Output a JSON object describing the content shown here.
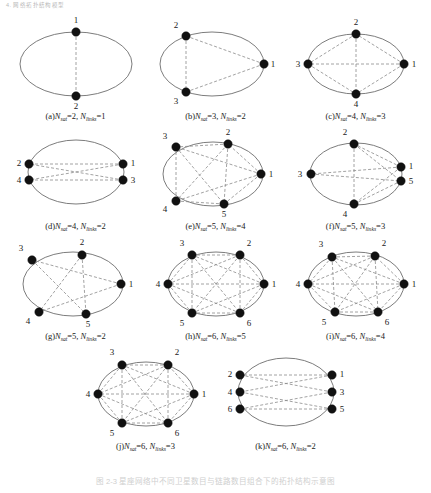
{
  "header": {
    "running_head": "4. 网络拓扑结构模型"
  },
  "figure": {
    "caption": "图 2-3   星座网络中不同卫星数目与链路数目组合下的拓扑结构示意图",
    "link_style": "dashed",
    "ellipse_style": "solid",
    "colors": {
      "node": "#111111",
      "ellipse": "#6d6d6d",
      "link": "#8a8a8a",
      "label": "#1a1a1a"
    },
    "symbols": {
      "n_sat": "N",
      "n_sat_sub": "sat",
      "n_links": "N",
      "n_links_sub": "links"
    },
    "panels": [
      {
        "id": "a",
        "tag": "(a)",
        "n_sat": 2,
        "n_links": 1,
        "caption_prefix": "(a)",
        "caption_text": "(a)Nsat=2, Nlinks=1",
        "width": 140,
        "height": 100,
        "ellipse": {
          "cx": 70,
          "cy": 52,
          "rx": 56,
          "ry": 32
        },
        "nodes": [
          {
            "label": "1",
            "x": 70,
            "y": 20,
            "lx": 70,
            "ly": 11,
            "anchor": "middle"
          },
          {
            "label": "2",
            "x": 70,
            "y": 84,
            "lx": 70,
            "ly": 97,
            "anchor": "middle"
          }
        ],
        "links": [
          [
            0,
            1
          ]
        ]
      },
      {
        "id": "b",
        "tag": "(b)",
        "n_sat": 3,
        "n_links": 2,
        "caption_prefix": "(b)",
        "caption_text": "(b)Nsat=3, Nlinks=2",
        "width": 140,
        "height": 100,
        "ellipse": {
          "cx": 66,
          "cy": 52,
          "rx": 52,
          "ry": 32
        },
        "nodes": [
          {
            "label": "1",
            "x": 118,
            "y": 52,
            "lx": 127,
            "ly": 55,
            "anchor": "middle"
          },
          {
            "label": "2",
            "x": 40,
            "y": 24,
            "lx": 30,
            "ly": 16,
            "anchor": "middle"
          },
          {
            "label": "3",
            "x": 40,
            "y": 80,
            "lx": 30,
            "ly": 92,
            "anchor": "middle"
          }
        ],
        "links": [
          [
            0,
            1
          ],
          [
            0,
            2
          ],
          [
            1,
            2
          ]
        ]
      },
      {
        "id": "c",
        "tag": "(c)",
        "n_sat": 4,
        "n_links": 3,
        "caption_prefix": "(c)",
        "caption_text": "(c)Nsat=4, Nlinks=3",
        "width": 140,
        "height": 100,
        "ellipse": {
          "cx": 70,
          "cy": 52,
          "rx": 48,
          "ry": 30
        },
        "nodes": [
          {
            "label": "1",
            "x": 118,
            "y": 52,
            "lx": 128,
            "ly": 55,
            "anchor": "middle"
          },
          {
            "label": "2",
            "x": 70,
            "y": 22,
            "lx": 70,
            "ly": 13,
            "anchor": "middle"
          },
          {
            "label": "3",
            "x": 22,
            "y": 52,
            "lx": 12,
            "ly": 55,
            "anchor": "middle"
          },
          {
            "label": "4",
            "x": 70,
            "y": 82,
            "lx": 70,
            "ly": 95,
            "anchor": "middle"
          }
        ],
        "links": [
          [
            0,
            1
          ],
          [
            0,
            2
          ],
          [
            0,
            3
          ],
          [
            1,
            2
          ],
          [
            1,
            3
          ],
          [
            2,
            3
          ]
        ]
      },
      {
        "id": "d",
        "tag": "(d)",
        "n_sat": 4,
        "n_links": 2,
        "caption_prefix": "(d)",
        "caption_text": "(d)Nsat=4, Nlinks=2",
        "width": 140,
        "height": 100,
        "ellipse": {
          "cx": 70,
          "cy": 50,
          "rx": 48,
          "ry": 32
        },
        "nodes": [
          {
            "label": "1",
            "x": 117,
            "y": 42,
            "lx": 127,
            "ly": 44,
            "anchor": "middle"
          },
          {
            "label": "2",
            "x": 23,
            "y": 42,
            "lx": 13,
            "ly": 44,
            "anchor": "middle"
          },
          {
            "label": "3",
            "x": 117,
            "y": 58,
            "lx": 127,
            "ly": 61,
            "anchor": "middle"
          },
          {
            "label": "4",
            "x": 23,
            "y": 58,
            "lx": 13,
            "ly": 61,
            "anchor": "middle"
          }
        ],
        "links": [
          [
            0,
            1
          ],
          [
            0,
            3
          ],
          [
            2,
            1
          ],
          [
            2,
            3
          ]
        ]
      },
      {
        "id": "e",
        "tag": "(e)",
        "n_sat": 5,
        "n_links": 4,
        "caption_prefix": "(e)",
        "caption_text": "(e)Nsat=5, Nlinks=4",
        "width": 140,
        "height": 100,
        "ellipse": {
          "cx": 67,
          "cy": 52,
          "rx": 50,
          "ry": 32
        },
        "nodes": [
          {
            "label": "1",
            "x": 115,
            "y": 52,
            "lx": 125,
            "ly": 55,
            "anchor": "middle"
          },
          {
            "label": "2",
            "x": 82,
            "y": 22,
            "lx": 82,
            "ly": 13,
            "anchor": "middle"
          },
          {
            "label": "3",
            "x": 30,
            "y": 25,
            "lx": 19,
            "ly": 17,
            "anchor": "middle"
          },
          {
            "label": "4",
            "x": 30,
            "y": 79,
            "lx": 19,
            "ly": 90,
            "anchor": "middle"
          },
          {
            "label": "5",
            "x": 78,
            "y": 82,
            "lx": 78,
            "ly": 95,
            "anchor": "middle"
          }
        ],
        "links": [
          [
            0,
            1
          ],
          [
            0,
            2
          ],
          [
            0,
            3
          ],
          [
            0,
            4
          ],
          [
            1,
            2
          ],
          [
            1,
            3
          ],
          [
            1,
            4
          ],
          [
            2,
            3
          ],
          [
            2,
            4
          ],
          [
            3,
            4
          ]
        ]
      },
      {
        "id": "f",
        "tag": "(f)",
        "n_sat": 5,
        "n_links": 3,
        "caption_prefix": "(f)",
        "caption_text": "(f)Nsat=5, Nlinks=3",
        "width": 140,
        "height": 100,
        "ellipse": {
          "cx": 70,
          "cy": 52,
          "rx": 46,
          "ry": 31
        },
        "nodes": [
          {
            "label": "1",
            "x": 115,
            "y": 45,
            "lx": 125,
            "ly": 47,
            "anchor": "middle"
          },
          {
            "label": "2",
            "x": 68,
            "y": 22,
            "lx": 59,
            "ly": 13,
            "anchor": "middle"
          },
          {
            "label": "3",
            "x": 25,
            "y": 52,
            "lx": 14,
            "ly": 55,
            "anchor": "middle"
          },
          {
            "label": "4",
            "x": 68,
            "y": 82,
            "lx": 59,
            "ly": 95,
            "anchor": "middle"
          },
          {
            "label": "5",
            "x": 115,
            "y": 59,
            "lx": 125,
            "ly": 62,
            "anchor": "middle"
          }
        ],
        "links": [
          [
            0,
            1
          ],
          [
            0,
            2
          ],
          [
            0,
            3
          ],
          [
            1,
            4
          ],
          [
            2,
            4
          ],
          [
            3,
            4
          ],
          [
            1,
            3
          ]
        ]
      },
      {
        "id": "g",
        "tag": "(g)",
        "n_sat": 5,
        "n_links": 2,
        "caption_prefix": "(g)",
        "caption_text": "(g)Nsat=5, Nlinks=2",
        "width": 140,
        "height": 100,
        "ellipse": {
          "cx": 67,
          "cy": 52,
          "rx": 50,
          "ry": 32
        },
        "nodes": [
          {
            "label": "1",
            "x": 115,
            "y": 52,
            "lx": 125,
            "ly": 55,
            "anchor": "middle"
          },
          {
            "label": "2",
            "x": 76,
            "y": 23,
            "lx": 76,
            "ly": 13,
            "anchor": "middle"
          },
          {
            "label": "3",
            "x": 26,
            "y": 28,
            "lx": 15,
            "ly": 19,
            "anchor": "middle"
          },
          {
            "label": "4",
            "x": 33,
            "y": 80,
            "lx": 22,
            "ly": 92,
            "anchor": "middle"
          },
          {
            "label": "5",
            "x": 80,
            "y": 82,
            "lx": 82,
            "ly": 95,
            "anchor": "middle"
          }
        ],
        "links": [
          [
            0,
            2
          ],
          [
            0,
            3
          ],
          [
            1,
            3
          ],
          [
            1,
            4
          ],
          [
            2,
            4
          ]
        ]
      },
      {
        "id": "h",
        "tag": "(h)",
        "n_sat": 6,
        "n_links": 5,
        "caption_prefix": "(h)",
        "caption_text": "(h)Nsat=6, Nlinks=5",
        "width": 140,
        "height": 100,
        "ellipse": {
          "cx": 70,
          "cy": 52,
          "rx": 48,
          "ry": 32
        },
        "nodes": [
          {
            "label": "1",
            "x": 118,
            "y": 52,
            "lx": 128,
            "ly": 55,
            "anchor": "middle"
          },
          {
            "label": "2",
            "x": 94,
            "y": 23,
            "lx": 103,
            "ly": 14,
            "anchor": "middle"
          },
          {
            "label": "3",
            "x": 46,
            "y": 23,
            "lx": 36,
            "ly": 14,
            "anchor": "middle"
          },
          {
            "label": "4",
            "x": 22,
            "y": 52,
            "lx": 12,
            "ly": 55,
            "anchor": "middle"
          },
          {
            "label": "5",
            "x": 46,
            "y": 81,
            "lx": 36,
            "ly": 94,
            "anchor": "middle"
          },
          {
            "label": "6",
            "x": 94,
            "y": 81,
            "lx": 103,
            "ly": 94,
            "anchor": "middle"
          }
        ],
        "links": [
          [
            0,
            1
          ],
          [
            0,
            2
          ],
          [
            0,
            3
          ],
          [
            0,
            4
          ],
          [
            0,
            5
          ],
          [
            1,
            2
          ],
          [
            1,
            3
          ],
          [
            1,
            4
          ],
          [
            1,
            5
          ],
          [
            2,
            3
          ],
          [
            2,
            4
          ],
          [
            2,
            5
          ],
          [
            3,
            4
          ],
          [
            3,
            5
          ],
          [
            4,
            5
          ]
        ]
      },
      {
        "id": "i",
        "tag": "(i)",
        "n_sat": 6,
        "n_links": 4,
        "caption_prefix": "(i)",
        "caption_text": "(i)Nsat=6, Nlinks=4",
        "width": 140,
        "height": 100,
        "ellipse": {
          "cx": 70,
          "cy": 52,
          "rx": 48,
          "ry": 32
        },
        "nodes": [
          {
            "label": "1",
            "x": 118,
            "y": 52,
            "lx": 128,
            "ly": 55,
            "anchor": "middle"
          },
          {
            "label": "2",
            "x": 89,
            "y": 24,
            "lx": 98,
            "ly": 14,
            "anchor": "middle"
          },
          {
            "label": "3",
            "x": 46,
            "y": 25,
            "lx": 35,
            "ly": 15,
            "anchor": "middle"
          },
          {
            "label": "4",
            "x": 22,
            "y": 52,
            "lx": 12,
            "ly": 55,
            "anchor": "middle"
          },
          {
            "label": "5",
            "x": 49,
            "y": 80,
            "lx": 38,
            "ly": 93,
            "anchor": "middle"
          },
          {
            "label": "6",
            "x": 92,
            "y": 80,
            "lx": 101,
            "ly": 93,
            "anchor": "middle"
          }
        ],
        "links": [
          [
            0,
            1
          ],
          [
            0,
            2
          ],
          [
            0,
            3
          ],
          [
            0,
            4
          ],
          [
            0,
            5
          ],
          [
            1,
            2
          ],
          [
            1,
            3
          ],
          [
            1,
            4
          ],
          [
            1,
            5
          ],
          [
            2,
            3
          ],
          [
            2,
            4
          ],
          [
            2,
            5
          ],
          [
            3,
            4
          ],
          [
            3,
            5
          ],
          [
            4,
            5
          ]
        ]
      },
      {
        "id": "j",
        "tag": "(j)",
        "n_sat": 6,
        "n_links": 3,
        "caption_prefix": "(j)",
        "caption_text": "(j)Nsat=6, Nlinks=3",
        "width": 140,
        "height": 100,
        "ellipse": {
          "cx": 70,
          "cy": 52,
          "rx": 48,
          "ry": 32
        },
        "nodes": [
          {
            "label": "1",
            "x": 118,
            "y": 52,
            "lx": 128,
            "ly": 55,
            "anchor": "middle"
          },
          {
            "label": "2",
            "x": 92,
            "y": 23,
            "lx": 101,
            "ly": 13,
            "anchor": "middle"
          },
          {
            "label": "3",
            "x": 46,
            "y": 23,
            "lx": 36,
            "ly": 13,
            "anchor": "middle"
          },
          {
            "label": "4",
            "x": 22,
            "y": 52,
            "lx": 12,
            "ly": 55,
            "anchor": "middle"
          },
          {
            "label": "5",
            "x": 46,
            "y": 81,
            "lx": 36,
            "ly": 94,
            "anchor": "middle"
          },
          {
            "label": "6",
            "x": 92,
            "y": 81,
            "lx": 101,
            "ly": 94,
            "anchor": "middle"
          }
        ],
        "links": [
          [
            0,
            1
          ],
          [
            0,
            2
          ],
          [
            0,
            3
          ],
          [
            0,
            4
          ],
          [
            0,
            5
          ],
          [
            1,
            2
          ],
          [
            1,
            3
          ],
          [
            1,
            4
          ],
          [
            1,
            5
          ],
          [
            2,
            3
          ],
          [
            2,
            4
          ],
          [
            2,
            5
          ],
          [
            3,
            4
          ],
          [
            3,
            5
          ],
          [
            4,
            5
          ]
        ]
      },
      {
        "id": "k",
        "tag": "(k)",
        "n_sat": 6,
        "n_links": 2,
        "caption_prefix": "(k)",
        "caption_text": "(k)Nsat=6, Nlinks=2",
        "width": 140,
        "height": 100,
        "ellipse": {
          "cx": 70,
          "cy": 50,
          "rx": 48,
          "ry": 34
        },
        "nodes": [
          {
            "label": "1",
            "x": 116,
            "y": 33,
            "lx": 126,
            "ly": 35,
            "anchor": "middle"
          },
          {
            "label": "2",
            "x": 24,
            "y": 33,
            "lx": 14,
            "ly": 35,
            "anchor": "middle"
          },
          {
            "label": "3",
            "x": 116,
            "y": 50,
            "lx": 126,
            "ly": 53,
            "anchor": "middle"
          },
          {
            "label": "4",
            "x": 24,
            "y": 50,
            "lx": 14,
            "ly": 53,
            "anchor": "middle"
          },
          {
            "label": "5",
            "x": 116,
            "y": 67,
            "lx": 126,
            "ly": 70,
            "anchor": "middle"
          },
          {
            "label": "6",
            "x": 24,
            "y": 67,
            "lx": 14,
            "ly": 70,
            "anchor": "middle"
          }
        ],
        "links": [
          [
            0,
            1
          ],
          [
            0,
            3
          ],
          [
            2,
            1
          ],
          [
            2,
            5
          ],
          [
            4,
            3
          ],
          [
            4,
            5
          ]
        ]
      }
    ],
    "rows": [
      [
        "a",
        "b",
        "c"
      ],
      [
        "d",
        "e",
        "f"
      ],
      [
        "g",
        "h",
        "i"
      ],
      [
        "j",
        "k"
      ]
    ]
  }
}
